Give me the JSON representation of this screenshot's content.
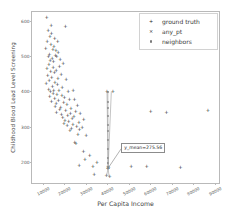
{
  "chart_data": {
    "type": "scatter",
    "title": "",
    "xlabel": "Per Capita Income",
    "ylabel": "Childhood Blood Lead Level Screening",
    "xlim": [
      5000,
      92000
    ],
    "ylim": [
      140,
      625
    ],
    "xticks": [
      10000,
      20000,
      30000,
      40000,
      50000,
      60000,
      70000,
      80000,
      90000
    ],
    "xtick_labels": [
      "10000",
      "20000",
      "30000",
      "40000",
      "50000",
      "60000",
      "70000",
      "80000",
      "90000"
    ],
    "yticks": [
      200,
      300,
      400,
      500,
      600
    ],
    "ytick_labels": [
      "200",
      "300",
      "400",
      "500",
      "600"
    ],
    "grid": false,
    "legend_position": "upper right",
    "legend": [
      {
        "label": "ground truth",
        "marker": "plus-marker",
        "color": "#1a1a1a"
      },
      {
        "label": "any_pt",
        "marker": "cross-marker",
        "color": "#1a1a1a"
      },
      {
        "label": "neighbors",
        "marker": "dot-marker",
        "color": "#7a7a7a"
      }
    ],
    "annotations": [
      {
        "text": "y_mean=275.56",
        "value": 275.56,
        "x": 46500,
        "y": 243,
        "arrow_to_x": 40400,
        "arrow_to_y": 182
      }
    ],
    "series": [
      {
        "name": "ground truth",
        "marker": "plus-marker",
        "color": "#1a1a1a",
        "points": [
          [
            11800,
            607
          ],
          [
            13900,
            586
          ],
          [
            20600,
            583
          ],
          [
            12500,
            572
          ],
          [
            14100,
            563
          ],
          [
            13300,
            553
          ],
          [
            15600,
            548
          ],
          [
            12100,
            541
          ],
          [
            16900,
            540
          ],
          [
            13800,
            531
          ],
          [
            15200,
            527
          ],
          [
            11400,
            520
          ],
          [
            14700,
            517
          ],
          [
            16100,
            513
          ],
          [
            17200,
            509
          ],
          [
            13100,
            504
          ],
          [
            15900,
            501
          ],
          [
            12700,
            498
          ],
          [
            16500,
            496
          ],
          [
            14400,
            492
          ],
          [
            18100,
            489
          ],
          [
            13500,
            485
          ],
          [
            15000,
            482
          ],
          [
            19500,
            478
          ],
          [
            12900,
            474
          ],
          [
            17800,
            470
          ],
          [
            14900,
            466
          ],
          [
            11900,
            462
          ],
          [
            16300,
            458
          ],
          [
            13700,
            455
          ],
          [
            15400,
            451
          ],
          [
            18600,
            447
          ],
          [
            12300,
            443
          ],
          [
            14200,
            439
          ],
          [
            17100,
            435
          ],
          [
            20900,
            432
          ],
          [
            13000,
            428
          ],
          [
            15700,
            424
          ],
          [
            11600,
            420
          ],
          [
            16800,
            417
          ],
          [
            14500,
            413
          ],
          [
            19100,
            409
          ],
          [
            12800,
            405
          ],
          [
            17500,
            402
          ],
          [
            15100,
            400
          ],
          [
            13600,
            398
          ],
          [
            21800,
            399
          ],
          [
            24200,
            401
          ],
          [
            39900,
            399
          ],
          [
            42600,
            398
          ],
          [
            14800,
            393
          ],
          [
            16600,
            390
          ],
          [
            18900,
            387
          ],
          [
            13200,
            384
          ],
          [
            20100,
            381
          ],
          [
            15500,
            378
          ],
          [
            22400,
            375
          ],
          [
            17300,
            372
          ],
          [
            24800,
            374
          ],
          [
            14000,
            369
          ],
          [
            19700,
            366
          ],
          [
            16200,
            363
          ],
          [
            21200,
            360
          ],
          [
            26100,
            358
          ],
          [
            15800,
            355
          ],
          [
            18300,
            352
          ],
          [
            23100,
            349
          ],
          [
            17900,
            346
          ],
          [
            20700,
            343
          ],
          [
            25300,
            341
          ],
          [
            16400,
            338
          ],
          [
            22900,
            335
          ],
          [
            27400,
            337
          ],
          [
            18700,
            332
          ],
          [
            21600,
            329
          ],
          [
            24500,
            327
          ],
          [
            19300,
            324
          ],
          [
            23700,
            321
          ],
          [
            29100,
            318
          ],
          [
            20300,
            316
          ],
          [
            22100,
            313
          ],
          [
            26800,
            311
          ],
          [
            60200,
            341
          ],
          [
            67600,
            338
          ],
          [
            86900,
            345
          ],
          [
            19900,
            308
          ],
          [
            24100,
            305
          ],
          [
            21400,
            302
          ],
          [
            25800,
            299
          ],
          [
            28300,
            296
          ],
          [
            23400,
            294
          ],
          [
            27100,
            291
          ],
          [
            22600,
            288
          ],
          [
            26400,
            276
          ],
          [
            30200,
            272
          ],
          [
            24900,
            253
          ],
          [
            25400,
            250
          ],
          [
            28900,
            229
          ],
          [
            31800,
            216
          ],
          [
            29600,
            206
          ],
          [
            35200,
            198
          ],
          [
            26900,
            189
          ],
          [
            33400,
            186
          ],
          [
            51200,
            185
          ],
          [
            58300,
            184
          ],
          [
            74100,
            182
          ],
          [
            40300,
            181
          ],
          [
            40700,
            183
          ],
          [
            33900,
            163
          ],
          [
            39600,
            160
          ],
          [
            41200,
            157
          ]
        ]
      },
      {
        "name": "any_pt",
        "marker": "cross-marker",
        "color": "#1a1a1a",
        "points": [
          [
            40400,
            182
          ]
        ]
      },
      {
        "name": "neighbors",
        "marker": "dot-marker",
        "color": "#7a7a7a",
        "points": [
          [
            40400,
            398
          ],
          [
            40200,
            370
          ],
          [
            40350,
            352
          ],
          [
            40300,
            331
          ],
          [
            40250,
            305
          ],
          [
            40400,
            288
          ],
          [
            40300,
            262
          ],
          [
            40350,
            236
          ],
          [
            40250,
            212
          ],
          [
            40400,
            196
          ],
          [
            40300,
            184
          ]
        ]
      }
    ],
    "neighbor_lines": [
      {
        "from": [
          40400,
          182
        ],
        "to": [
          41900,
          399
        ]
      },
      {
        "from": [
          40400,
          182
        ],
        "to": [
          39900,
          399
        ]
      },
      {
        "from": [
          40400,
          182
        ],
        "to": [
          40300,
          398
        ]
      },
      {
        "from": [
          40400,
          182
        ],
        "to": [
          40900,
          157
        ]
      },
      {
        "from": [
          40400,
          182
        ],
        "to": [
          39700,
          160
        ]
      }
    ]
  }
}
